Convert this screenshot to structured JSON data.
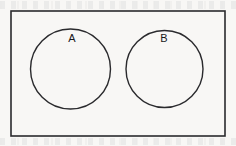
{
  "figure": {
    "kind": "venn-diagram",
    "canvas": {
      "width": 236,
      "height": 146
    },
    "background_color": "#f8f7f5",
    "ink_color": "#18181a",
    "stroke_color": "#2a2a2d"
  },
  "universe": {
    "name": "universal-set-rectangle",
    "label": "",
    "x": 11,
    "y": 11,
    "width": 214,
    "height": 125,
    "stroke_width": 1.6,
    "fill": "none"
  },
  "sets": [
    {
      "id": "set-a",
      "label": "A",
      "cx": 70.5,
      "cy": 69,
      "r": 40,
      "label_x": 72,
      "label_y": 39,
      "stroke_width": 1.4,
      "fill": "none"
    },
    {
      "id": "set-b",
      "label": "B",
      "cx": 164.5,
      "cy": 69,
      "r": 38.5,
      "label_x": 164,
      "label_y": 39,
      "stroke_width": 1.4,
      "fill": "none"
    }
  ],
  "relationship": {
    "type": "disjoint",
    "description": "A and B do not overlap"
  }
}
